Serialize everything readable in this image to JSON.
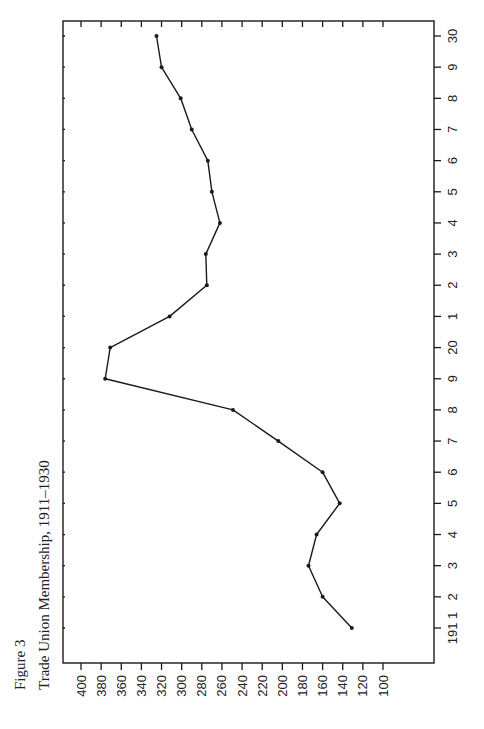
{
  "figure": {
    "label": "Figure 3",
    "title": "Trade Union Membership, 1911–1930"
  },
  "chart_data": {
    "type": "line",
    "title": "Trade Union Membership, 1911–1930",
    "figure_label": "Figure 3",
    "orientation": "rotated 90° counter-clockwise on page (years run along right edge, values along bottom edge)",
    "xlabel": "Year",
    "ylabel": "Membership",
    "x": [
      1911,
      1912,
      1913,
      1914,
      1915,
      1916,
      1917,
      1918,
      1919,
      1920,
      1921,
      1922,
      1923,
      1924,
      1925,
      1926,
      1927,
      1928,
      1929,
      1930
    ],
    "x_tick_labels": [
      "191 1",
      "2",
      "3",
      "4",
      "5",
      "6",
      "7",
      "8",
      "9",
      "20",
      "1",
      "2",
      "3",
      "4",
      "5",
      "6",
      "7",
      "8",
      "9",
      "30"
    ],
    "series": [
      {
        "name": "Trade Union Membership",
        "values": [
          131,
          160,
          174,
          166,
          143,
          160,
          204,
          249,
          376,
          371,
          312,
          275,
          276,
          262,
          270,
          274,
          290,
          301,
          320,
          325
        ]
      }
    ],
    "y_ticks": [
      400,
      380,
      360,
      340,
      320,
      300,
      280,
      260,
      240,
      220,
      200,
      180,
      160,
      140,
      120,
      100
    ],
    "ylim": [
      100,
      400
    ],
    "value_axis_reversed": true,
    "grid": false,
    "legend": "none",
    "markers": "small filled dots",
    "line_color": "#1a1a1a"
  }
}
